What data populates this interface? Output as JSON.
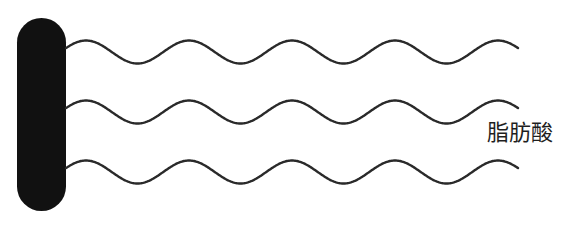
{
  "diagram": {
    "head": {
      "shape": "rounded-bar",
      "color": "#111111",
      "x": 17,
      "y": 18,
      "width": 49,
      "height": 193
    },
    "tails": {
      "count": 3,
      "stroke_color": "#2a2a2a",
      "stroke_width": 2.4,
      "start_x": 66,
      "end_x": 518,
      "period": 103,
      "amplitude": 11.5,
      "center_y": [
        52,
        112,
        172
      ]
    },
    "label": {
      "text": "脂肪酸",
      "color": "#1f1f1f"
    }
  }
}
